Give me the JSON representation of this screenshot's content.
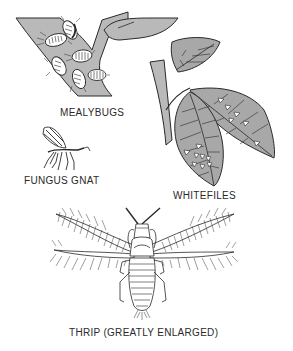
{
  "figure": {
    "type": "illustration",
    "colors": {
      "background": "#ffffff",
      "fill_gray": "#b9b9b9",
      "leaf_gray": "#a8a8a8",
      "line": "#2a2a2a",
      "insect_white": "#ffffff"
    }
  },
  "labels": {
    "mealybugs": "MEALYBUGS",
    "fungus_gnat": "FUNGUS GNAT",
    "whiteflies": "WHITEFILES",
    "thrip": "THRIP (GREATLY ENLARGED)"
  },
  "panels": [
    {
      "id": "mealybugs",
      "icon": "mealybug-on-branch-icon"
    },
    {
      "id": "fungus_gnat",
      "icon": "fungus-gnat-icon"
    },
    {
      "id": "whiteflies",
      "icon": "whiteflies-on-leaves-icon"
    },
    {
      "id": "thrip",
      "icon": "thrip-icon"
    }
  ]
}
